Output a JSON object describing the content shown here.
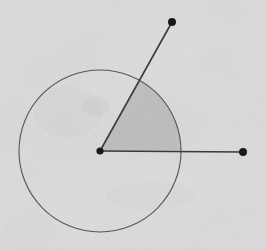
{
  "scene": {
    "title": "Hand-drawn angle with circle and shaded sector",
    "width": 266,
    "height": 249,
    "background_color": "#dcdcdc",
    "paper_texture": "mottled-gray-paper"
  },
  "chart_data": {
    "type": "diagram",
    "title": "Angle with shaded sector inscribed in a circle",
    "subtitle": "",
    "xlabel": "",
    "ylabel": "",
    "grid": false,
    "legend": "none",
    "units": "pixels",
    "coordinate_note": "Image pixel coordinates, origin at top-left, y increases downward",
    "circle": {
      "name": "reference-circle",
      "center_x": 100,
      "center_y": 151,
      "radius": 81,
      "stroke_color": "#55555a",
      "stroke_width": 1.1,
      "fill": "none"
    },
    "vertex": {
      "name": "angle-vertex",
      "x": 100,
      "y": 151,
      "dot_radius": 3.6,
      "color": "#1a1a1a"
    },
    "rays": [
      {
        "name": "upper-ray",
        "from_x": 100,
        "from_y": 151,
        "to_x": 172,
        "to_y": 22,
        "angle_degrees": 60.8,
        "length": 147.7,
        "stroke_color": "#3a3a3e",
        "stroke_width": 1.6,
        "endpoint_dot_radius": 4.0,
        "endpoint_dot_color": "#1a1a1a"
      },
      {
        "name": "right-ray",
        "from_x": 100,
        "from_y": 151,
        "to_x": 243,
        "to_y": 152,
        "angle_degrees": 0.4,
        "length": 143.0,
        "stroke_color": "#3a3a3e",
        "stroke_width": 1.6,
        "endpoint_dot_radius": 4.0,
        "endpoint_dot_color": "#1a1a1a"
      }
    ],
    "sector": {
      "name": "shaded-angle-sector",
      "center_x": 100,
      "center_y": 151,
      "radius": 81,
      "start_angle_degrees": 0.4,
      "end_angle_degrees": 60.8,
      "sweep_degrees": 60.4,
      "fill_color": "#b3b3b3",
      "fill_opacity": 0.75,
      "stroke": "none",
      "arc_start_x": 181,
      "arc_start_y": 150,
      "arc_end_x": 139,
      "arc_end_y": 80
    },
    "measured_angle_degrees": 60.4,
    "annotations": [],
    "tick_labels": [],
    "series": []
  }
}
